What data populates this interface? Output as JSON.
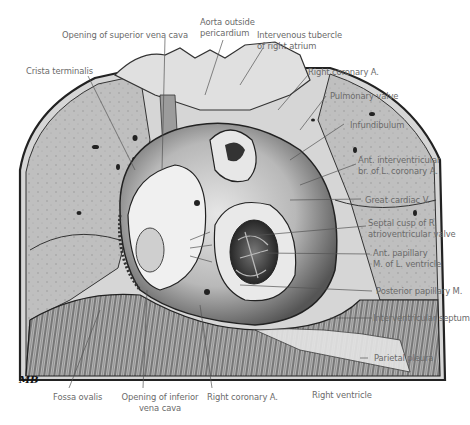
{
  "figure": {
    "style": "grayscale anatomical illustration",
    "artist_signature": "MB"
  },
  "labels": {
    "opening_svc": "Opening of superior vena cava",
    "aorta_l1": "Aorta outside",
    "aorta_l2": "pericardium",
    "intervenous_l1": "Intervenous tubercle",
    "intervenous_l2": "of right atrium",
    "crista": "Crista terminalis",
    "right_coronary_top": "Right coronary A.",
    "pulmonary_valve": "Pulmonary valve",
    "infundibulum": "Infundibulum",
    "ant_interventricular_l1": "Ant. interventricular",
    "ant_interventricular_l2": "br. of L. coronary A.",
    "great_cardiac": "Great cardiac V.",
    "septal_cusp_l1": "Septal cusp of R.",
    "septal_cusp_l2": "atrioventricular valve",
    "ant_papillary_l1": "Ant. papillary",
    "ant_papillary_l2": "M. of L. ventricle",
    "posterior_papillary": "Posterior papillary M.",
    "interventricular_septum": "Interventricular septum",
    "parietal_pleura": "Parietal pleura",
    "fossa_ovalis": "Fossa ovalis",
    "opening_ivc_l1": "Opening of inferior",
    "opening_ivc_l2": "vena cava",
    "right_coronary_bottom": "Right coronary A.",
    "right_ventricle": "Right ventricle"
  },
  "colors": {
    "label_text": "#6a6a6a",
    "leader_line": "#555555",
    "lung": "#bdbdbd",
    "heart_light": "#d9d9d9",
    "heart_dark": "#3a3a3a",
    "diaphragm": "#9a9a9a"
  }
}
